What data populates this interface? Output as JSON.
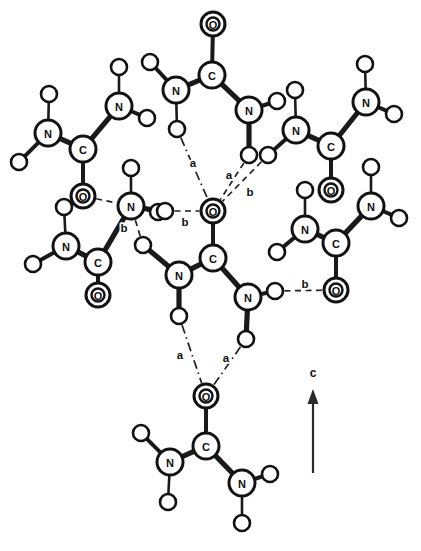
{
  "figure": {
    "background_color": "#ffffff",
    "line_color": "#1a1a1a",
    "atom_fill": "#ffffff",
    "width": 421,
    "height": 551
  },
  "axis": {
    "name": "crystallographic-axis",
    "label": "c",
    "direction": "up",
    "x": 313,
    "y_tail": 473,
    "y_head": 389,
    "label_x": 313,
    "label_y": 373
  },
  "legend_symbols": {
    "carbon": "C",
    "nitrogen": "N",
    "oxygen": "O",
    "hydrogen": ""
  },
  "chart_data": {
    "type": "diagram",
    "subtitle": "",
    "xlabel": "",
    "ylabel": "",
    "legend_position": "none",
    "grid": false,
    "bond_types": [
      {
        "id": "covalent",
        "style": "solid",
        "description": "covalent bond"
      },
      {
        "id": "a",
        "style": "dash-dot",
        "description": "hydrogen bond type a"
      },
      {
        "id": "b",
        "style": "dashed",
        "description": "hydrogen bond type b"
      }
    ],
    "atoms": [
      {
        "id": "a1",
        "element": "N",
        "label": "N",
        "x": 48,
        "y": 133,
        "r": 13,
        "double": false
      },
      {
        "id": "a2",
        "element": "H",
        "label": "",
        "x": 49,
        "y": 94,
        "r": 8,
        "double": false
      },
      {
        "id": "a3",
        "element": "H",
        "label": "",
        "x": 19,
        "y": 162,
        "r": 8,
        "double": false
      },
      {
        "id": "a4",
        "element": "C",
        "label": "C",
        "x": 83,
        "y": 149,
        "r": 13,
        "double": false
      },
      {
        "id": "a5",
        "element": "O",
        "label": "O",
        "x": 83,
        "y": 196,
        "r": 12,
        "double": true
      },
      {
        "id": "a6",
        "element": "N",
        "label": "N",
        "x": 119,
        "y": 106,
        "r": 13,
        "double": false
      },
      {
        "id": "a7",
        "element": "H",
        "label": "",
        "x": 119,
        "y": 67,
        "r": 8,
        "double": false
      },
      {
        "id": "a8",
        "element": "H",
        "label": "",
        "x": 147,
        "y": 118,
        "r": 8,
        "double": false
      },
      {
        "id": "b1",
        "element": "C",
        "label": "C",
        "x": 212,
        "y": 75,
        "r": 13,
        "double": false
      },
      {
        "id": "b2",
        "element": "O",
        "label": "O",
        "x": 213,
        "y": 24,
        "r": 12,
        "double": true
      },
      {
        "id": "b3",
        "element": "N",
        "label": "N",
        "x": 176,
        "y": 90,
        "r": 13,
        "double": false
      },
      {
        "id": "b4",
        "element": "H",
        "label": "",
        "x": 150,
        "y": 62,
        "r": 8,
        "double": false
      },
      {
        "id": "b5",
        "element": "H",
        "label": "",
        "x": 177,
        "y": 129,
        "r": 8,
        "double": false
      },
      {
        "id": "b6",
        "element": "N",
        "label": "N",
        "x": 249,
        "y": 110,
        "r": 13,
        "double": false
      },
      {
        "id": "b7",
        "element": "H",
        "label": "",
        "x": 277,
        "y": 101,
        "r": 8,
        "double": false
      },
      {
        "id": "b8",
        "element": "H",
        "label": "",
        "x": 249,
        "y": 155,
        "r": 8,
        "double": false
      },
      {
        "id": "c1",
        "element": "N",
        "label": "N",
        "x": 296,
        "y": 130,
        "r": 13,
        "double": false
      },
      {
        "id": "c2",
        "element": "H",
        "label": "",
        "x": 295,
        "y": 90,
        "r": 8,
        "double": false
      },
      {
        "id": "c3",
        "element": "H",
        "label": "",
        "x": 268,
        "y": 155,
        "r": 8,
        "double": false
      },
      {
        "id": "c4",
        "element": "C",
        "label": "C",
        "x": 331,
        "y": 146,
        "r": 13,
        "double": false
      },
      {
        "id": "c5",
        "element": "O",
        "label": "O",
        "x": 331,
        "y": 190,
        "r": 12,
        "double": true
      },
      {
        "id": "c6",
        "element": "N",
        "label": "N",
        "x": 366,
        "y": 102,
        "r": 13,
        "double": false
      },
      {
        "id": "c7",
        "element": "H",
        "label": "",
        "x": 365,
        "y": 64,
        "r": 8,
        "double": false
      },
      {
        "id": "c8",
        "element": "H",
        "label": "",
        "x": 394,
        "y": 114,
        "r": 8,
        "double": false
      },
      {
        "id": "d1",
        "element": "N",
        "label": "N",
        "x": 66,
        "y": 246,
        "r": 13,
        "double": false
      },
      {
        "id": "d2",
        "element": "H",
        "label": "",
        "x": 64,
        "y": 207,
        "r": 8,
        "double": false
      },
      {
        "id": "d3",
        "element": "H",
        "label": "",
        "x": 33,
        "y": 264,
        "r": 8,
        "double": false
      },
      {
        "id": "d4",
        "element": "C",
        "label": "C",
        "x": 98,
        "y": 262,
        "r": 13,
        "double": false
      },
      {
        "id": "d5",
        "element": "O",
        "label": "O",
        "x": 98,
        "y": 295,
        "r": 12,
        "double": true
      },
      {
        "id": "d6",
        "element": "N",
        "label": "N",
        "x": 131,
        "y": 206,
        "r": 13,
        "double": false
      },
      {
        "id": "d7",
        "element": "H",
        "label": "",
        "x": 131,
        "y": 168,
        "r": 8,
        "double": false
      },
      {
        "id": "d8",
        "element": "H",
        "label": "",
        "x": 158,
        "y": 212,
        "r": 8,
        "double": false
      },
      {
        "id": "e1",
        "element": "O",
        "label": "O",
        "x": 213,
        "y": 211,
        "r": 12,
        "double": true
      },
      {
        "id": "e2",
        "element": "C",
        "label": "C",
        "x": 213,
        "y": 258,
        "r": 13,
        "double": false
      },
      {
        "id": "e3",
        "element": "N",
        "label": "N",
        "x": 179,
        "y": 275,
        "r": 13,
        "double": false
      },
      {
        "id": "e4",
        "element": "H",
        "label": "",
        "x": 179,
        "y": 316,
        "r": 8,
        "double": false
      },
      {
        "id": "e5",
        "element": "N",
        "label": "N",
        "x": 248,
        "y": 297,
        "r": 13,
        "double": false
      },
      {
        "id": "e6",
        "element": "H",
        "label": "",
        "x": 275,
        "y": 291,
        "r": 8,
        "double": false
      },
      {
        "id": "e7",
        "element": "H",
        "label": "",
        "x": 246,
        "y": 339,
        "r": 8,
        "double": false
      },
      {
        "id": "f1",
        "element": "N",
        "label": "N",
        "x": 305,
        "y": 229,
        "r": 13,
        "double": false
      },
      {
        "id": "f2",
        "element": "H",
        "label": "",
        "x": 305,
        "y": 190,
        "r": 8,
        "double": false
      },
      {
        "id": "f3",
        "element": "H",
        "label": "",
        "x": 277,
        "y": 252,
        "r": 8,
        "double": false
      },
      {
        "id": "f4",
        "element": "C",
        "label": "C",
        "x": 336,
        "y": 243,
        "r": 13,
        "double": false
      },
      {
        "id": "f5",
        "element": "O",
        "label": "O",
        "x": 336,
        "y": 290,
        "r": 12,
        "double": true
      },
      {
        "id": "f6",
        "element": "N",
        "label": "N",
        "x": 371,
        "y": 206,
        "r": 13,
        "double": false
      },
      {
        "id": "f7",
        "element": "H",
        "label": "",
        "x": 371,
        "y": 167,
        "r": 8,
        "double": false
      },
      {
        "id": "f8",
        "element": "H",
        "label": "",
        "x": 399,
        "y": 218,
        "r": 8,
        "double": false
      },
      {
        "id": "g1",
        "element": "O",
        "label": "O",
        "x": 206,
        "y": 396,
        "r": 12,
        "double": true
      },
      {
        "id": "g2",
        "element": "C",
        "label": "C",
        "x": 206,
        "y": 446,
        "r": 13,
        "double": false
      },
      {
        "id": "g3",
        "element": "N",
        "label": "N",
        "x": 170,
        "y": 462,
        "r": 13,
        "double": false
      },
      {
        "id": "g4",
        "element": "H",
        "label": "",
        "x": 141,
        "y": 433,
        "r": 8,
        "double": false
      },
      {
        "id": "g5",
        "element": "H",
        "label": "",
        "x": 168,
        "y": 502,
        "r": 8,
        "double": false
      },
      {
        "id": "g6",
        "element": "N",
        "label": "N",
        "x": 242,
        "y": 483,
        "r": 13,
        "double": false
      },
      {
        "id": "g7",
        "element": "H",
        "label": "",
        "x": 270,
        "y": 474,
        "r": 8,
        "double": false
      },
      {
        "id": "g8",
        "element": "H",
        "label": "",
        "x": 242,
        "y": 523,
        "r": 8,
        "double": false
      },
      {
        "id": "h1",
        "element": "H",
        "label": "",
        "x": 165,
        "y": 211,
        "r": 8,
        "double": false
      },
      {
        "id": "h2",
        "element": "H",
        "label": "",
        "x": 143,
        "y": 245,
        "r": 8,
        "double": false
      }
    ],
    "covalent_bonds": [
      {
        "from": "a1",
        "to": "a2",
        "weight": "thin"
      },
      {
        "from": "a1",
        "to": "a3",
        "weight": "medium"
      },
      {
        "from": "a1",
        "to": "a4",
        "weight": "thick"
      },
      {
        "from": "a4",
        "to": "a5",
        "weight": "medium"
      },
      {
        "from": "a4",
        "to": "a6",
        "weight": "thick"
      },
      {
        "from": "a6",
        "to": "a7",
        "weight": "thin"
      },
      {
        "from": "a6",
        "to": "a8",
        "weight": "medium"
      },
      {
        "from": "b1",
        "to": "b2",
        "weight": "medium"
      },
      {
        "from": "b1",
        "to": "b3",
        "weight": "thick"
      },
      {
        "from": "b3",
        "to": "b4",
        "weight": "medium"
      },
      {
        "from": "b3",
        "to": "b5",
        "weight": "thin"
      },
      {
        "from": "b1",
        "to": "b6",
        "weight": "thick"
      },
      {
        "from": "b6",
        "to": "b7",
        "weight": "medium"
      },
      {
        "from": "b6",
        "to": "b8",
        "weight": "thick"
      },
      {
        "from": "c1",
        "to": "c2",
        "weight": "thin"
      },
      {
        "from": "c1",
        "to": "c3",
        "weight": "medium"
      },
      {
        "from": "c1",
        "to": "c4",
        "weight": "thick"
      },
      {
        "from": "c4",
        "to": "c5",
        "weight": "medium"
      },
      {
        "from": "c4",
        "to": "c6",
        "weight": "thick"
      },
      {
        "from": "c6",
        "to": "c7",
        "weight": "thin"
      },
      {
        "from": "c6",
        "to": "c8",
        "weight": "medium"
      },
      {
        "from": "d1",
        "to": "d2",
        "weight": "thin"
      },
      {
        "from": "d1",
        "to": "d3",
        "weight": "medium"
      },
      {
        "from": "d1",
        "to": "d4",
        "weight": "thick"
      },
      {
        "from": "d4",
        "to": "d5",
        "weight": "medium"
      },
      {
        "from": "d4",
        "to": "d6",
        "weight": "thick"
      },
      {
        "from": "d6",
        "to": "d7",
        "weight": "thin"
      },
      {
        "from": "d6",
        "to": "d8",
        "weight": "medium"
      },
      {
        "from": "e1",
        "to": "e2",
        "weight": "medium"
      },
      {
        "from": "e2",
        "to": "e3",
        "weight": "thick"
      },
      {
        "from": "e3",
        "to": "e4",
        "weight": "thick"
      },
      {
        "from": "e2",
        "to": "e5",
        "weight": "thick"
      },
      {
        "from": "e5",
        "to": "e6",
        "weight": "medium"
      },
      {
        "from": "e5",
        "to": "e7",
        "weight": "thick"
      },
      {
        "from": "f1",
        "to": "f2",
        "weight": "thin"
      },
      {
        "from": "f1",
        "to": "f3",
        "weight": "medium"
      },
      {
        "from": "f1",
        "to": "f4",
        "weight": "thick"
      },
      {
        "from": "f4",
        "to": "f5",
        "weight": "medium"
      },
      {
        "from": "f4",
        "to": "f6",
        "weight": "thick"
      },
      {
        "from": "f6",
        "to": "f7",
        "weight": "thin"
      },
      {
        "from": "f6",
        "to": "f8",
        "weight": "medium"
      },
      {
        "from": "g1",
        "to": "g2",
        "weight": "medium"
      },
      {
        "from": "g2",
        "to": "g3",
        "weight": "thick"
      },
      {
        "from": "g3",
        "to": "g4",
        "weight": "medium"
      },
      {
        "from": "g3",
        "to": "g5",
        "weight": "thin"
      },
      {
        "from": "g2",
        "to": "g6",
        "weight": "thick"
      },
      {
        "from": "g6",
        "to": "g7",
        "weight": "medium"
      },
      {
        "from": "g6",
        "to": "g8",
        "weight": "thin"
      },
      {
        "from": "h1",
        "to": "d6",
        "weight": "medium"
      },
      {
        "from": "h2",
        "to": "e3",
        "weight": "thick"
      }
    ],
    "hydrogen_bonds": [
      {
        "from": "b5",
        "to": "e1",
        "type": "a",
        "style": "dashdot",
        "label": "a",
        "label_x": 193,
        "label_y": 163
      },
      {
        "from": "b8",
        "to": "e1",
        "type": "a",
        "style": "dashed",
        "label": "a",
        "label_x": 229,
        "label_y": 175
      },
      {
        "from": "c3",
        "to": "e1",
        "type": "b",
        "style": "dashed",
        "label": "b",
        "label_x": 250,
        "label_y": 192
      },
      {
        "from": "h1",
        "to": "e1",
        "type": "b",
        "style": "dashed",
        "label": "b",
        "label_x": 185,
        "label_y": 222
      },
      {
        "from": "e4",
        "to": "g1",
        "type": "a",
        "style": "dashdot",
        "label": "a",
        "label_x": 180,
        "label_y": 355
      },
      {
        "from": "e7",
        "to": "g1",
        "type": "a",
        "style": "dashdot",
        "label": "a",
        "label_x": 226,
        "label_y": 358
      },
      {
        "from": "e6",
        "to": "f5",
        "type": "b",
        "style": "dashed",
        "label": "b",
        "label_x": 305,
        "label_y": 284
      },
      {
        "from": "h2",
        "to": "d6",
        "type": "b",
        "style": "dashed",
        "label": "b",
        "label_x": 124,
        "label_y": 228
      },
      {
        "from": "a5",
        "to": "d6",
        "type": "b",
        "style": "dashed",
        "label": "",
        "label_x": 0,
        "label_y": 0
      }
    ]
  }
}
